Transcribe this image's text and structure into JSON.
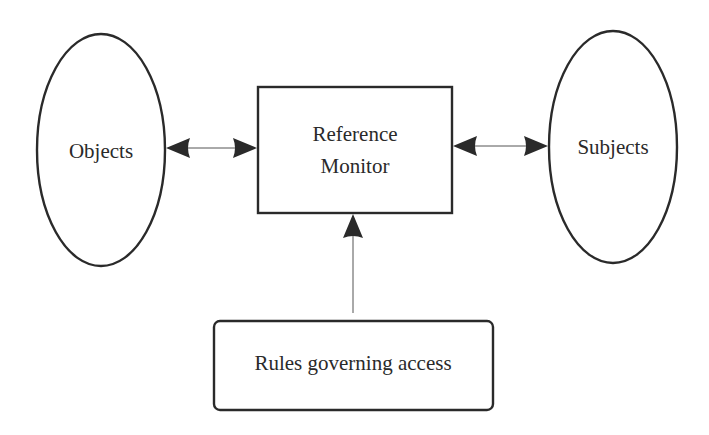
{
  "diagram": {
    "title": "",
    "nodes": {
      "objects": {
        "label": "Objects",
        "shape": "ellipse"
      },
      "reference_monitor": {
        "label_line1": "Reference",
        "label_line2": "Monitor",
        "shape": "rectangle"
      },
      "subjects": {
        "label": "Subjects",
        "shape": "ellipse"
      },
      "rules": {
        "label": "Rules governing access",
        "shape": "rounded-rectangle"
      }
    },
    "edges": [
      {
        "from": "objects",
        "to": "reference_monitor",
        "direction": "bidirectional"
      },
      {
        "from": "reference_monitor",
        "to": "subjects",
        "direction": "bidirectional"
      },
      {
        "from": "rules",
        "to": "reference_monitor",
        "direction": "one-way"
      }
    ],
    "colors": {
      "stroke": "#2a2a2a",
      "background": "#ffffff",
      "connector": "#555555"
    }
  }
}
